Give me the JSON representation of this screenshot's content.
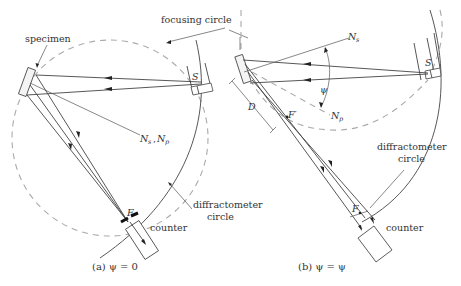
{
  "figure": {
    "labels": {
      "focusing_circle": "focusing circle",
      "specimen": "specimen",
      "source": "S",
      "normals_a": "N",
      "normals_a_sub1": "s",
      "normals_a_sub2": "p",
      "diffractometer_circle_a_line1": "diffractometer",
      "diffractometer_circle_a_line2": "circle",
      "focus_a": "F",
      "counter_a": "counter",
      "normal_s_b": "N",
      "normal_s_b_sub": "s",
      "normal_p_b": "N",
      "normal_p_b_sub": "p",
      "psi_angle": "ψ",
      "distance_d": "D",
      "focus_prime": "F′",
      "source_b": "S",
      "diffractometer_circle_b_line1": "diffractometer",
      "diffractometer_circle_b_line2": "circle",
      "focus_b": "F",
      "counter_b": "counter"
    },
    "captions": {
      "a": "(a)  ψ  =  0",
      "b": "(b)  ψ  =  ψ"
    }
  }
}
